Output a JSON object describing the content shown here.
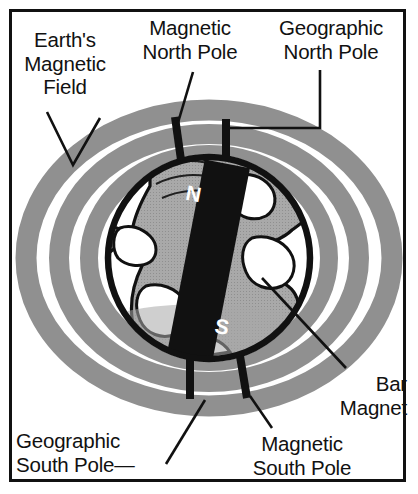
{
  "figure": {
    "title_text_present": false,
    "background_color": "#ffffff",
    "frame_color": "#111111",
    "field_band_color": "#909090",
    "landmass_color": "#a8a8a8",
    "ocean_color": "#ffffff",
    "magnet_color": "#111111",
    "outline_color": "#111111"
  },
  "labels": {
    "earths_magnetic_field": "Earth's\nMagnetic\nField",
    "magnetic_north_pole": "Magnetic\nNorth Pole",
    "geographic_north_pole": "Geographic\nNorth Pole",
    "bar_magnet": "Bar\nMagnet",
    "geographic_south_pole": "Geographic\nSouth Pole—",
    "magnetic_south_pole": "Magnetic\nSouth Pole"
  },
  "magnet": {
    "north_glyph": "N",
    "south_glyph": "S",
    "tilt_degrees": 11
  },
  "diagram_data": {
    "type": "diagram",
    "subject": "Earth's magnetic field and bar magnet model",
    "elements": [
      {
        "name": "earths-magnetic-field",
        "role": "field-lines",
        "count": 3,
        "shape": "concentric-ellipse-bands"
      },
      {
        "name": "globe",
        "role": "earth-sphere"
      },
      {
        "name": "bar-magnet",
        "role": "dipole-magnet",
        "poles": [
          "N",
          "S"
        ]
      },
      {
        "name": "magnetic-north-pole",
        "role": "pole-marker",
        "position": "upper-left-of-globe-top"
      },
      {
        "name": "geographic-north-pole",
        "role": "pole-marker",
        "position": "globe-top"
      },
      {
        "name": "geographic-south-pole",
        "role": "pole-marker",
        "position": "globe-bottom"
      },
      {
        "name": "magnetic-south-pole",
        "role": "pole-marker",
        "position": "lower-right-of-globe-bottom"
      }
    ]
  }
}
